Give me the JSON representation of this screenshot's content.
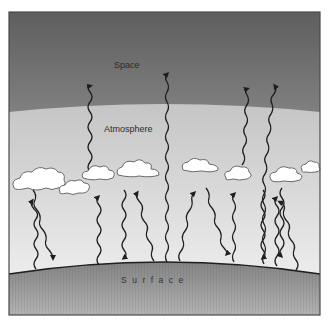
{
  "diagram": {
    "labels": {
      "space": "Space",
      "atmosphere": "Atmosphere",
      "surface": "Surface"
    },
    "regions": [
      {
        "name": "space",
        "color_top": "#5e5e5e",
        "color_bottom": "#7e7e7e"
      },
      {
        "name": "atmosphere",
        "color_top": "#b3b3b3",
        "color_bottom": "#f4f4f4"
      },
      {
        "name": "surface",
        "color_top": "#8a8a8a",
        "color_bottom": "#b0b0b0"
      }
    ],
    "colors": {
      "frame": "#555555",
      "arrow": "#1e1e1e",
      "cloud_fill": "#ffffff",
      "cloud_stroke": "#6a6a6a"
    },
    "elements": {
      "clouds": 10,
      "arrows_to_space": 4,
      "arrows_to_atmosphere_top": 3,
      "arrows_surface_to_cloud": 7,
      "arrows_cloud_to_surface": 5
    }
  }
}
